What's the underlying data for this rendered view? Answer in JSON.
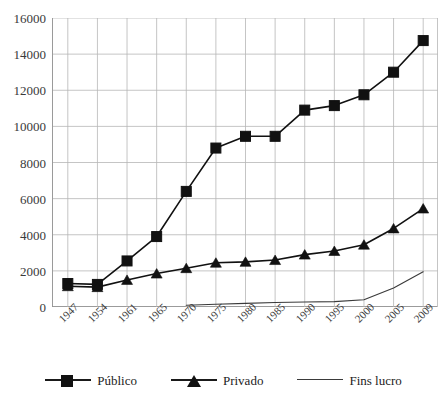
{
  "title_sliver": "",
  "axes": {
    "ylim": [
      0,
      16000
    ],
    "ystep": 2000,
    "yticks": [
      "0",
      "2000",
      "4000",
      "6000",
      "8000",
      "10000",
      "12000",
      "14000",
      "16000"
    ],
    "grid": true,
    "grid_color": "#b6b6b6",
    "axis_color": "#8a8a8a"
  },
  "legend": {
    "position": "bottom",
    "items": [
      {
        "label": "Público",
        "marker": "square",
        "color": "#111111"
      },
      {
        "label": "Privado",
        "marker": "triangle",
        "color": "#111111"
      },
      {
        "label": "Fins lucro",
        "marker": "none",
        "color": "#3a3a3a"
      }
    ]
  },
  "chart_data": {
    "type": "line",
    "title": "",
    "xlabel": "",
    "ylabel": "",
    "ylim": [
      0,
      16000
    ],
    "grid": true,
    "legend_position": "bottom",
    "categories": [
      "1947",
      "1954",
      "1961",
      "1965",
      "1970",
      "1975",
      "1980",
      "1985",
      "1990",
      "1995",
      "2000",
      "2005",
      "2009"
    ],
    "series": [
      {
        "name": "Público",
        "marker": "square",
        "color": "#111111",
        "values": [
          1300,
          1250,
          2550,
          3900,
          6400,
          8800,
          9450,
          9450,
          10900,
          11150,
          11750,
          13000,
          14750
        ]
      },
      {
        "name": "Privado",
        "marker": "triangle",
        "color": "#111111",
        "values": [
          1150,
          1100,
          1500,
          1850,
          2150,
          2450,
          2500,
          2600,
          2900,
          3100,
          3450,
          4350,
          5450
        ]
      },
      {
        "name": "Fins lucro",
        "marker": "none",
        "color": "#3a3a3a",
        "values": [
          null,
          null,
          null,
          null,
          100,
          150,
          200,
          250,
          280,
          300,
          400,
          1050,
          1950
        ]
      }
    ]
  }
}
